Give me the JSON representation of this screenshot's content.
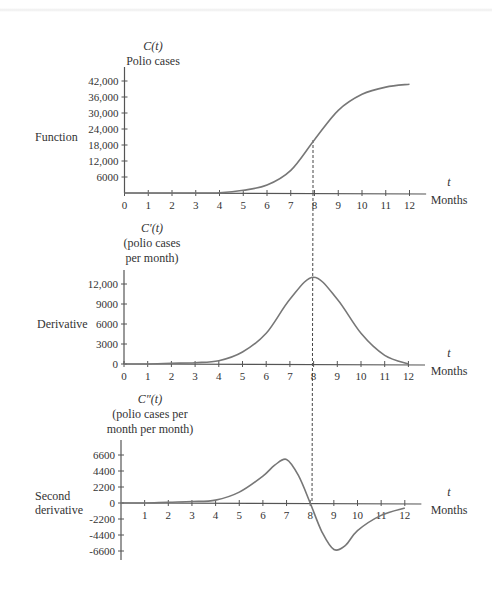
{
  "chart_data": [
    {
      "type": "line",
      "panel": "function",
      "row_label": "Function",
      "title_lines": [
        "C(t)",
        "Polio cases"
      ],
      "xlabel": "t",
      "xlabel_units": "Months",
      "ylabel": "C(t) Polio cases",
      "x_ticks": [
        0,
        1,
        2,
        3,
        4,
        5,
        6,
        7,
        8,
        9,
        10,
        11,
        12
      ],
      "y_ticks": [
        6000,
        12000,
        18000,
        24000,
        30000,
        36000,
        42000
      ],
      "y_tick_labels": [
        "6000",
        "12,000",
        "18,000",
        "24,000",
        "30,000",
        "36,000",
        "42,000"
      ],
      "xlim": [
        0,
        12.7
      ],
      "ylim": [
        0,
        48000
      ],
      "x": [
        0,
        1,
        2,
        3,
        4,
        5,
        6,
        7,
        8,
        9,
        10,
        11,
        12
      ],
      "values": [
        0,
        0,
        0,
        0,
        100,
        1000,
        3000,
        8500,
        20000,
        31000,
        37000,
        39700,
        40800
      ],
      "annotation": "dashed vertical line at t = 8"
    },
    {
      "type": "line",
      "panel": "derivative",
      "row_label": "Derivative",
      "title_lines": [
        "C′(t)",
        "(polio cases",
        "per month)"
      ],
      "xlabel": "t",
      "xlabel_units": "Months",
      "x_ticks": [
        0,
        1,
        2,
        3,
        4,
        5,
        6,
        7,
        8,
        9,
        10,
        11,
        12
      ],
      "y_ticks": [
        0,
        3000,
        6000,
        9000,
        12000
      ],
      "y_tick_labels": [
        "0",
        "3000",
        "6000",
        "9000",
        "12,000"
      ],
      "xlim": [
        0,
        12.7
      ],
      "ylim": [
        0,
        15000
      ],
      "x": [
        0,
        1,
        2,
        3,
        4,
        5,
        6,
        7,
        8,
        9,
        10,
        11,
        12
      ],
      "values": [
        0,
        0,
        100,
        200,
        500,
        1800,
        4600,
        9700,
        13000,
        9700,
        4600,
        1300,
        0
      ],
      "annotation": "maximum at t = 8"
    },
    {
      "type": "line",
      "panel": "second-derivative",
      "row_label": "Second derivative",
      "title_lines": [
        "C″(t)",
        "(polio cases per",
        "month per month)"
      ],
      "xlabel": "t",
      "xlabel_units": "Months",
      "x_ticks": [
        1,
        2,
        3,
        4,
        5,
        6,
        7,
        8,
        9,
        10,
        11,
        12
      ],
      "y_ticks": [
        -6600,
        -4400,
        -2200,
        0,
        2200,
        4400,
        6600
      ],
      "y_tick_labels": [
        "-6600",
        "-4400",
        "-2200",
        "0",
        "2200",
        "4400",
        "6600"
      ],
      "xlim": [
        0,
        12.7
      ],
      "ylim": [
        -7000,
        8800
      ],
      "x": [
        0,
        1,
        2,
        3,
        4,
        5,
        6,
        6.5,
        7,
        7.5,
        8,
        8.5,
        9,
        9.5,
        10,
        11,
        12
      ],
      "values": [
        0,
        0,
        100,
        200,
        400,
        1500,
        3700,
        5200,
        6000,
        3800,
        0,
        -4000,
        -6400,
        -5800,
        -3800,
        -1700,
        -700
      ],
      "annotation": "zero crossing at t = 8"
    }
  ],
  "text": {
    "function_label": "Function",
    "derivative_label": "Derivative",
    "second_label_1": "Second",
    "second_label_2": "derivative",
    "t": "t",
    "months": "Months"
  }
}
